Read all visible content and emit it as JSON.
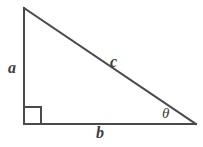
{
  "figure": {
    "name": "right-triangle-diagram",
    "background_color": "#ffffff",
    "stroke_color": "#4a4a4a",
    "label_color": "#3d3d3d",
    "stroke_width": 2
  },
  "geometry": {
    "apex": {
      "x": 24,
      "y": 8
    },
    "right_angle_vertex": {
      "x": 24,
      "y": 124
    },
    "theta_vertex": {
      "x": 196,
      "y": 124
    },
    "right_angle_marker": {
      "x": 24,
      "y": 107,
      "size": 17
    }
  },
  "labels": {
    "vertical_leg": "a",
    "horizontal_leg": "b",
    "hypotenuse": "c",
    "angle": "θ"
  }
}
